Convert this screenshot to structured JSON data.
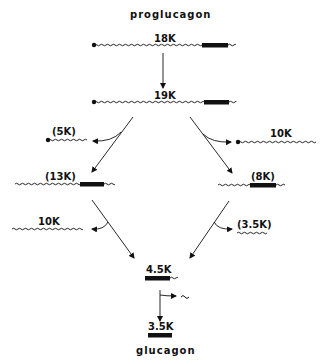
{
  "diagram": {
    "title_top": "proglucagon",
    "title_bottom": "glucagon",
    "colors": {
      "ink": "#111111",
      "background": "#ffffff"
    },
    "nodes": {
      "n18k": {
        "label": "18K"
      },
      "n19k": {
        "label": "19K"
      },
      "n5k": {
        "label": "(5K)"
      },
      "n10k_right": {
        "label": "10K"
      },
      "n13k": {
        "label": "(13K)"
      },
      "n8k": {
        "label": "(8K)"
      },
      "n10k_left": {
        "label": "10K"
      },
      "n3_5k_frag": {
        "label": "(3.5K)"
      },
      "n4_5k": {
        "label": "4.5K"
      },
      "n3_5k": {
        "label": "3.5K"
      },
      "tilde_fragment": {
        "label": "~"
      }
    },
    "edges": [
      {
        "from": "18K",
        "to": "19K"
      },
      {
        "from": "19K",
        "to": "(13K)",
        "side_product": "(5K)"
      },
      {
        "from": "19K",
        "to": "(8K)",
        "side_product": "10K"
      },
      {
        "from": "(13K)",
        "to": "4.5K",
        "side_product": "10K"
      },
      {
        "from": "(8K)",
        "to": "4.5K",
        "side_product": "(3.5K)"
      },
      {
        "from": "4.5K",
        "to": "3.5K",
        "side_product": "~"
      }
    ]
  }
}
